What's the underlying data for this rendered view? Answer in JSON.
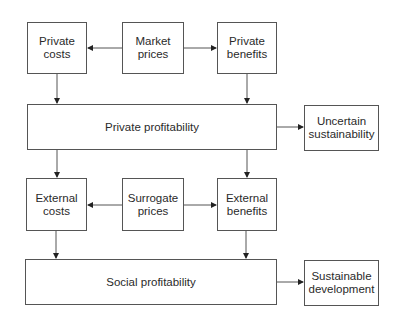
{
  "diagram": {
    "colors": {
      "stroke": "#555555",
      "text": "#2a2a2a",
      "background": "#ffffff"
    },
    "nodes": {
      "private_costs": {
        "label": "Private\ncosts"
      },
      "market_prices": {
        "label": "Market\nprices"
      },
      "private_benefits": {
        "label": "Private\nbenefits"
      },
      "private_profitability": {
        "label": "Private profitability"
      },
      "uncertain_sustainability": {
        "label": "Uncertain\nsustainability"
      },
      "external_costs": {
        "label": "External\ncosts"
      },
      "surrogate_prices": {
        "label": "Surrogate\nprices"
      },
      "external_benefits": {
        "label": "External\nbenefits"
      },
      "social_profitability": {
        "label": "Social profitability"
      },
      "sustainable_development": {
        "label": "Sustainable\ndevelopment"
      }
    },
    "edges": [
      {
        "from": "market_prices",
        "to": "private_costs"
      },
      {
        "from": "market_prices",
        "to": "private_benefits"
      },
      {
        "from": "private_costs",
        "to": "private_profitability"
      },
      {
        "from": "private_benefits",
        "to": "private_profitability"
      },
      {
        "from": "private_profitability",
        "to": "uncertain_sustainability"
      },
      {
        "from": "private_profitability",
        "to": "external_costs"
      },
      {
        "from": "private_profitability",
        "to": "external_benefits"
      },
      {
        "from": "surrogate_prices",
        "to": "external_costs"
      },
      {
        "from": "surrogate_prices",
        "to": "external_benefits"
      },
      {
        "from": "external_costs",
        "to": "social_profitability"
      },
      {
        "from": "external_benefits",
        "to": "social_profitability"
      },
      {
        "from": "social_profitability",
        "to": "sustainable_development"
      }
    ]
  }
}
